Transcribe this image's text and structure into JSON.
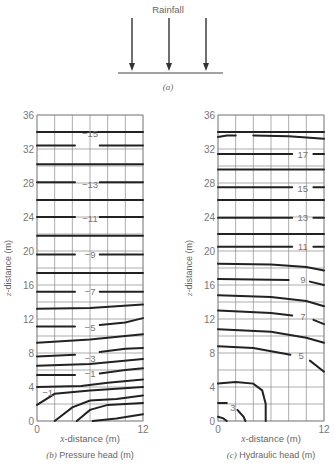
{
  "panel_a": {
    "title": "Rainfall",
    "caption": "(a)",
    "arrow_count": 3
  },
  "panel_b": {
    "caption_letter": "(b)",
    "caption_text": "Pressure head (m)",
    "xlabel": "x-distance (m)",
    "ylabel": "z-distance (m)"
  },
  "panel_c": {
    "caption_letter": "(c)",
    "caption_text": "Hydraulic head (m)",
    "xlabel": "x-distance (m)",
    "ylabel": "z-distance (m)"
  },
  "chart_data": [
    {
      "type": "contour",
      "title": "(b) Pressure head (m)",
      "xlabel": "x-distance (m)",
      "ylabel": "z-distance (m)",
      "xlim": [
        0,
        12
      ],
      "ylim": [
        0,
        36
      ],
      "x_ticks": [
        0,
        12
      ],
      "y_ticks": [
        0,
        4,
        8,
        12,
        16,
        20,
        24,
        28,
        32,
        36
      ],
      "grid": true,
      "grid_x_spacing": 2,
      "grid_z_spacing": 2,
      "contour_labels": [
        {
          "value": "-15",
          "x": 6,
          "z": 33.8
        },
        {
          "value": "-13",
          "x": 6,
          "z": 27.8
        },
        {
          "value": "-11",
          "x": 6,
          "z": 23.8
        },
        {
          "value": "-9",
          "x": 6,
          "z": 19.6
        },
        {
          "value": "-7",
          "x": 6,
          "z": 15.2
        },
        {
          "value": "-5",
          "x": 6,
          "z": 11.0
        },
        {
          "value": "-3",
          "x": 6,
          "z": 7.4
        },
        {
          "value": "-1",
          "x": 6,
          "z": 5.6
        },
        {
          "value": "-1",
          "x": 1.2,
          "z": 3.3
        }
      ],
      "contours": [
        {
          "points": [
            [
              0,
              34.0
            ],
            [
              12,
              34.0
            ]
          ]
        },
        {
          "points": [
            [
              0,
              32.4
            ],
            [
              4.3,
              32.4
            ]
          ],
          "points2": [
            [
              7.1,
              32.4
            ],
            [
              12,
              32.4
            ]
          ]
        },
        {
          "points": [
            [
              0,
              30.2
            ],
            [
              12,
              30.2
            ]
          ]
        },
        {
          "points": [
            [
              0,
              28.1
            ],
            [
              4.3,
              28.1
            ]
          ],
          "points2": [
            [
              7.1,
              28.1
            ],
            [
              12,
              28.1
            ]
          ]
        },
        {
          "points": [
            [
              0,
              26.0
            ],
            [
              12,
              26.0
            ]
          ]
        },
        {
          "points": [
            [
              0,
              24.0
            ],
            [
              4.3,
              24.0
            ]
          ],
          "points2": [
            [
              7.1,
              24.0
            ],
            [
              12,
              24.0
            ]
          ]
        },
        {
          "points": [
            [
              0,
              21.8
            ],
            [
              12,
              21.8
            ]
          ]
        },
        {
          "points": [
            [
              0,
              19.6
            ],
            [
              4.3,
              19.6
            ]
          ],
          "points2": [
            [
              7.1,
              19.6
            ],
            [
              12,
              19.6
            ]
          ]
        },
        {
          "points": [
            [
              0,
              17.4
            ],
            [
              12,
              17.4
            ]
          ]
        },
        {
          "points": [
            [
              0,
              15.2
            ],
            [
              4.3,
              15.2
            ]
          ],
          "points2": [
            [
              7.1,
              15.2
            ],
            [
              12,
              15.2
            ]
          ]
        },
        {
          "points": [
            [
              0,
              13.2
            ],
            [
              6,
              13.3
            ],
            [
              12,
              13.7
            ]
          ]
        },
        {
          "points": [
            [
              0,
              11.1
            ],
            [
              4.3,
              11.1
            ]
          ],
          "points2": [
            [
              7.1,
              11.3
            ],
            [
              10,
              11.6
            ],
            [
              12,
              12.1
            ]
          ]
        },
        {
          "points": [
            [
              0,
              9.2
            ],
            [
              6,
              9.6
            ],
            [
              12,
              10.2
            ]
          ]
        },
        {
          "points": [
            [
              0,
              7.6
            ],
            [
              4.3,
              7.8
            ]
          ],
          "points2": [
            [
              7.1,
              8.1
            ],
            [
              10,
              8.5
            ],
            [
              12,
              8.6
            ]
          ]
        },
        {
          "points": [
            [
              0,
              6.5
            ],
            [
              6,
              6.7
            ],
            [
              12,
              7.3
            ]
          ]
        },
        {
          "points": [
            [
              0,
              5.4
            ],
            [
              4.3,
              5.4
            ]
          ],
          "points2": [
            [
              7.1,
              5.6
            ],
            [
              10,
              6.0
            ],
            [
              12,
              6.2
            ]
          ]
        },
        {
          "points": [
            [
              0,
              4.0
            ],
            [
              5,
              4.1
            ],
            [
              8,
              4.5
            ],
            [
              12,
              4.9
            ]
          ]
        },
        {
          "points": [
            [
              0,
              1.9
            ],
            [
              2,
              3.2
            ],
            [
              6,
              3.6
            ],
            [
              12,
              4.0
            ]
          ]
        },
        {
          "points": [
            [
              2,
              0
            ],
            [
              4,
              1.6
            ],
            [
              6,
              2.4
            ],
            [
              9,
              2.6
            ],
            [
              12,
              3.0
            ]
          ]
        },
        {
          "points": [
            [
              4.5,
              0
            ],
            [
              6,
              1.3
            ],
            [
              8,
              1.9
            ],
            [
              12,
              2.1
            ]
          ]
        },
        {
          "points": [
            [
              6.3,
              0
            ],
            [
              9,
              0.3
            ],
            [
              12,
              0.8
            ]
          ]
        }
      ]
    },
    {
      "type": "contour",
      "title": "(c) Hydraulic head (m)",
      "xlabel": "x-distance (m)",
      "ylabel": "z-distance (m)",
      "xlim": [
        0,
        12
      ],
      "ylim": [
        0,
        36
      ],
      "x_ticks": [
        0,
        12
      ],
      "y_ticks": [
        0,
        4,
        8,
        12,
        16,
        20,
        24,
        28,
        32,
        36
      ],
      "grid": true,
      "contour_labels": [
        {
          "value": "17",
          "x": 9.6,
          "z": 31.4
        },
        {
          "value": "15",
          "x": 9.6,
          "z": 27.4
        },
        {
          "value": "13",
          "x": 9.6,
          "z": 23.9
        },
        {
          "value": "11",
          "x": 9.6,
          "z": 20.5
        },
        {
          "value": "9",
          "x": 9.6,
          "z": 16.6
        },
        {
          "value": "7",
          "x": 9.6,
          "z": 12.3
        },
        {
          "value": "5",
          "x": 9.4,
          "z": 7.7
        },
        {
          "value": "3",
          "x": 1.7,
          "z": 1.6
        }
      ],
      "contours": [
        {
          "points": [
            [
              0,
              34.0
            ],
            [
              12,
              34.0
            ]
          ]
        },
        {
          "points": [
            [
              0,
              33.4
            ],
            [
              1,
              33.6
            ],
            [
              2,
              33.6
            ]
          ],
          "points2": [
            [
              4,
              33.6
            ],
            [
              8,
              33.5
            ],
            [
              12,
              33.2
            ]
          ]
        },
        {
          "points": [
            [
              0,
              31.4
            ],
            [
              8.4,
              31.4
            ]
          ],
          "points2": [
            [
              10.8,
              31.4
            ],
            [
              12,
              31.4
            ]
          ]
        },
        {
          "points": [
            [
              0,
              29.6
            ],
            [
              12,
              29.6
            ]
          ]
        },
        {
          "points": [
            [
              0,
              27.5
            ],
            [
              8.4,
              27.5
            ]
          ],
          "points2": [
            [
              10.8,
              27.5
            ],
            [
              12,
              27.5
            ]
          ]
        },
        {
          "points": [
            [
              0,
              26.0
            ],
            [
              12,
              26.0
            ]
          ]
        },
        {
          "points": [
            [
              0,
              23.9
            ],
            [
              8.4,
              23.9
            ]
          ],
          "points2": [
            [
              10.8,
              23.9
            ],
            [
              12,
              23.9
            ]
          ]
        },
        {
          "points": [
            [
              0,
              22.0
            ],
            [
              12,
              22.0
            ]
          ]
        },
        {
          "points": [
            [
              0,
              20.5
            ],
            [
              8.4,
              20.5
            ]
          ],
          "points2": [
            [
              10.8,
              20.5
            ],
            [
              12,
              20.5
            ]
          ]
        },
        {
          "points": [
            [
              0,
              18.5
            ],
            [
              6,
              18.4
            ],
            [
              10,
              18.1
            ],
            [
              12,
              17.7
            ]
          ]
        },
        {
          "points": [
            [
              0,
              16.7
            ],
            [
              8,
              16.6
            ]
          ],
          "points2": [
            [
              10.4,
              16.4
            ],
            [
              12,
              16.0
            ]
          ]
        },
        {
          "points": [
            [
              0,
              14.8
            ],
            [
              6,
              14.6
            ],
            [
              10,
              14.1
            ],
            [
              12,
              13.5
            ]
          ]
        },
        {
          "points": [
            [
              0,
              13.0
            ],
            [
              6,
              12.7
            ],
            [
              8.4,
              12.4
            ]
          ],
          "points2": [
            [
              10.8,
              11.9
            ],
            [
              12,
              11.4
            ]
          ]
        },
        {
          "points": [
            [
              0,
              10.8
            ],
            [
              6,
              10.5
            ],
            [
              10,
              9.8
            ],
            [
              12,
              9.2
            ]
          ]
        },
        {
          "points": [
            [
              0,
              8.8
            ],
            [
              4,
              8.6
            ],
            [
              8.2,
              7.8
            ]
          ],
          "points2": [
            [
              10.4,
              7.1
            ],
            [
              12,
              5.8
            ]
          ]
        },
        {
          "points": [
            [
              0,
              4.4
            ],
            [
              2,
              4.6
            ],
            [
              4,
              4.4
            ],
            [
              5,
              3.6
            ],
            [
              5.4,
              2
            ],
            [
              5.4,
              0
            ]
          ]
        },
        {
          "points": [
            [
              0,
              2.1
            ],
            [
              1,
              2.1
            ]
          ],
          "points2": [
            [
              2.2,
              1.3
            ],
            [
              2.9,
              0.5
            ],
            [
              3.1,
              0
            ]
          ]
        },
        {
          "points": [
            [
              0,
              0.5
            ],
            [
              0.6,
              0.3
            ],
            [
              1,
              0
            ]
          ]
        }
      ]
    }
  ]
}
